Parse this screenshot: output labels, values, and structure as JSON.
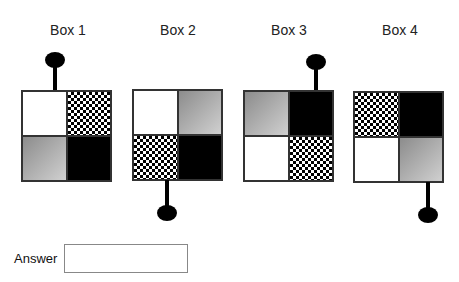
{
  "boxes": [
    {
      "label": "Box 1",
      "cells": [
        "white",
        "checker",
        "gray",
        "black"
      ],
      "handle": {
        "position": "top",
        "column": "left"
      }
    },
    {
      "label": "Box 2",
      "cells": [
        "white",
        "gray",
        "checker",
        "black"
      ],
      "handle": {
        "position": "bottom",
        "column": "left"
      }
    },
    {
      "label": "Box 3",
      "cells": [
        "gray",
        "black",
        "white",
        "checker"
      ],
      "handle": {
        "position": "top",
        "column": "right"
      }
    },
    {
      "label": "Box 4",
      "cells": [
        "checker",
        "black",
        "white",
        "gray"
      ],
      "handle": {
        "position": "bottom",
        "column": "right"
      }
    }
  ],
  "answer": {
    "label": "Answer",
    "value": "",
    "placeholder": ""
  }
}
